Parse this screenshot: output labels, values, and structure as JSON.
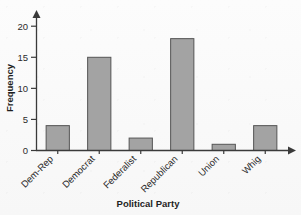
{
  "chart_data": {
    "type": "bar",
    "title": "",
    "xlabel": "Political Party",
    "ylabel": "Frequency",
    "categories": [
      "Dem-Rep",
      "Democrat",
      "Federalist",
      "Republican",
      "Union",
      "Whig"
    ],
    "values": [
      4,
      15,
      2,
      18,
      1,
      4
    ],
    "ylim": [
      0,
      21
    ],
    "yticks": [
      0,
      5,
      10,
      15,
      20
    ],
    "ytick_labels": [
      "0",
      "5",
      "10",
      "15",
      "20"
    ],
    "grid": false,
    "legend": false,
    "bar_color": "#a3a3a3",
    "bar_edge_color": "#555555",
    "axis_color": "#3a3a3a",
    "background_color": "#fbfbfb",
    "x_tick_label_rotation": -45,
    "axis_arrowheads": true
  },
  "axes": {
    "y_axis_name": "y-axis",
    "x_axis_name": "x-axis"
  }
}
